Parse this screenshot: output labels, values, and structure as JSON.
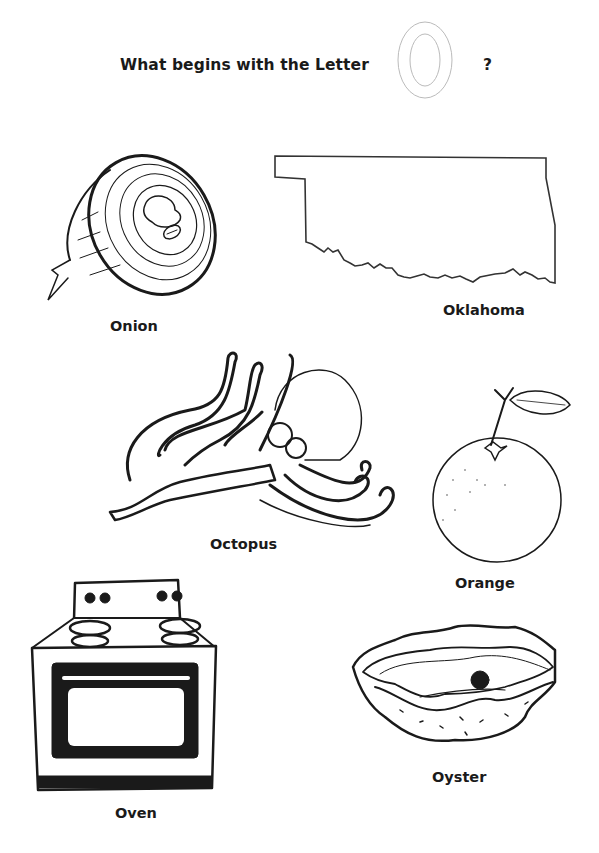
{
  "header": {
    "title": "What begins with the Letter",
    "letter": "O",
    "question_mark": "?"
  },
  "items": [
    {
      "name": "onion",
      "label": "Onion"
    },
    {
      "name": "oklahoma",
      "label": "Oklahoma"
    },
    {
      "name": "octopus",
      "label": "Octopus"
    },
    {
      "name": "orange",
      "label": "Orange"
    },
    {
      "name": "oven",
      "label": "Oven"
    },
    {
      "name": "oyster",
      "label": "Oyster"
    }
  ],
  "colors": {
    "ink": "#1a1a1a",
    "outline_letter": "#bbbbbb",
    "background": "#ffffff"
  }
}
